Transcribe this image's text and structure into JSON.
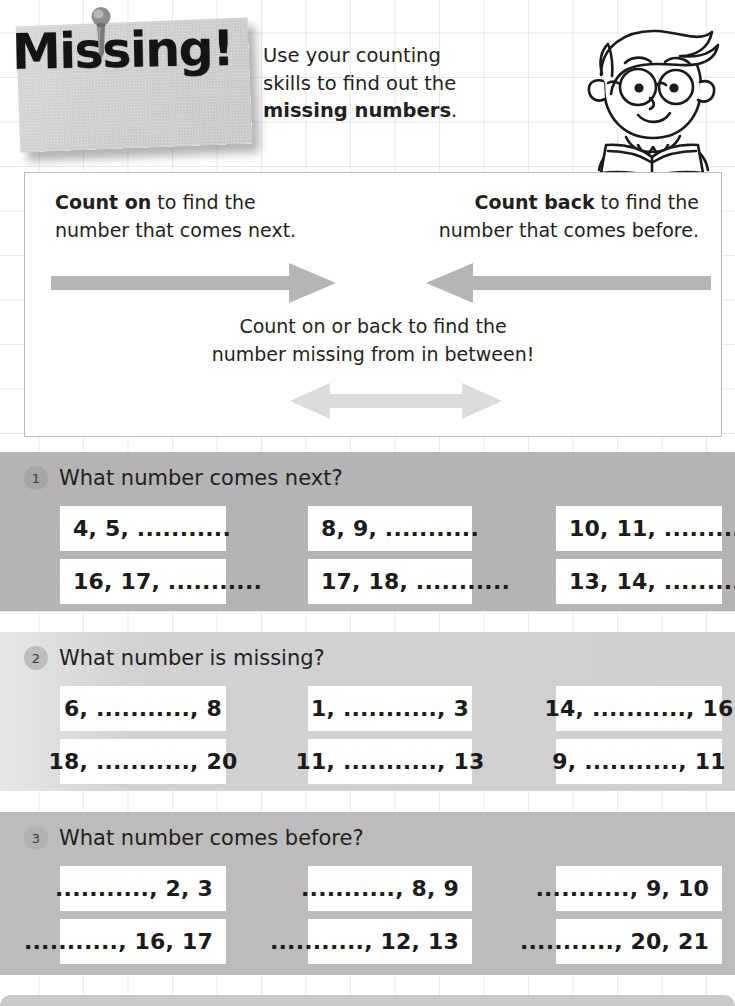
{
  "header": {
    "note_title": "Missing!",
    "intro_line1": "Use your counting",
    "intro_line2": "skills to find out the",
    "intro_bold": "missing numbers",
    "intro_period": "."
  },
  "instructions": {
    "left_bold": "Count on",
    "left_rest": " to find the",
    "left_line2": "number that comes next.",
    "right_bold": "Count back",
    "right_rest": " to find the",
    "right_line2": "number that comes before.",
    "bottom_line1": "Count on or back to find the",
    "bottom_line2": "number missing from in between!"
  },
  "sections": [
    {
      "number": "1",
      "title": "What number comes next?",
      "align": "align-left",
      "rows": [
        [
          "4, 5, ...........",
          "8, 9, ...........",
          "10, 11, ..........."
        ],
        [
          "16, 17, ...........",
          "17, 18, ...........",
          "13, 14, ..........."
        ]
      ]
    },
    {
      "number": "2",
      "title": "What number is missing?",
      "align": "align-center",
      "rows": [
        [
          "6, ..........., 8",
          "1, ..........., 3",
          "14, ..........., 16"
        ],
        [
          "18, ..........., 20",
          "11, ..........., 13",
          "9, ..........., 11"
        ]
      ]
    },
    {
      "number": "3",
      "title": "What number comes before?",
      "align": "align-right",
      "rows": [
        [
          "..........., 2, 3",
          "..........., 8, 9",
          "..........., 9, 10"
        ],
        [
          "..........., 16, 17",
          "..........., 12, 13",
          "..........., 20, 21"
        ]
      ]
    }
  ],
  "colors": {
    "section1_band": "#b4b4b4",
    "section2_band": "#d2d2d2",
    "section3_band": "#bcbcbc",
    "arrow_dark": "#b5b5b5",
    "arrow_light": "#dcdcdc",
    "text": "#231f20",
    "panel_border": "#b9bcbf"
  },
  "icons": {
    "pin": "pushpin-icon",
    "boy": "boy-reading-book-icon",
    "arrow_right": "arrow-right-icon",
    "arrow_left": "arrow-left-icon",
    "arrow_double": "arrow-double-headed-icon"
  }
}
